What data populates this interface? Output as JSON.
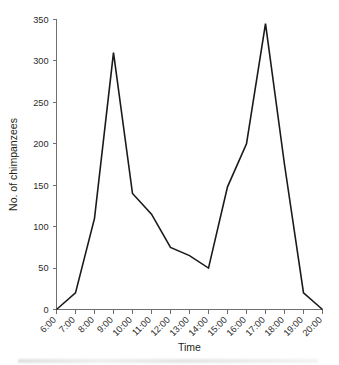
{
  "chart_data": {
    "type": "line",
    "title": "",
    "xlabel": "Time",
    "ylabel": "No. of chimpanzees",
    "categories": [
      "6:00",
      "7:00",
      "8:00",
      "9:00",
      "10:00",
      "11:00",
      "12:00",
      "13:00",
      "14:00",
      "15:00",
      "16:00",
      "17:00",
      "18:00",
      "19:00",
      "20:00"
    ],
    "values": [
      0,
      20,
      110,
      310,
      140,
      115,
      75,
      65,
      50,
      148,
      200,
      345,
      175,
      20,
      0
    ],
    "series": [
      {
        "name": "No. of chimpanzees",
        "values": [
          0,
          20,
          110,
          310,
          140,
          115,
          75,
          65,
          50,
          148,
          200,
          345,
          175,
          20,
          0
        ]
      }
    ],
    "ylim": [
      0,
      350
    ],
    "yticks": [
      0,
      50,
      100,
      150,
      200,
      250,
      300,
      350
    ],
    "ytick_labels": [
      "0",
      "50",
      "100",
      "150",
      "200",
      "250",
      "300",
      "350"
    ],
    "xtick_labels": [
      "6:00",
      "7:00",
      "8:00",
      "9:00",
      "10:00",
      "11:00",
      "12:00",
      "13:00",
      "14:00",
      "15:00",
      "16:00",
      "17:00",
      "18:00",
      "19:00",
      "20:00"
    ],
    "xtick_rotation": -45,
    "grid": false,
    "legend": false,
    "legend_position": "none",
    "line_color": "#1a1a1a",
    "axis_color": "#6f6f6f",
    "background_color": "#ffffff"
  }
}
